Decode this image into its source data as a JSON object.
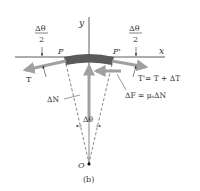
{
  "figure": {
    "caption": "(b)",
    "axes": {
      "x_label": "x",
      "y_label": "y"
    },
    "points": {
      "P": "P",
      "P_prime": "P'",
      "O": "O"
    },
    "angles": {
      "half_left_num": "Δθ",
      "half_left_den": "2",
      "half_right_num": "Δθ",
      "half_right_den": "2",
      "center": "Δθ"
    },
    "forces": {
      "tension_left": "T",
      "tension_right": "T'= T + ΔT",
      "normal": "ΔN",
      "friction": "ΔF = μₛΔN"
    },
    "colors": {
      "belt": "#5a5a5a",
      "arrow": "#a0a0a0",
      "line": "#333333"
    }
  }
}
